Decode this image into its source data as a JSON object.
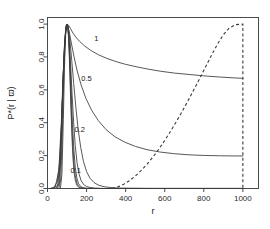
{
  "chart_data": {
    "type": "line",
    "title": "",
    "xlabel": "r",
    "ylabel": "P*(r | ϖ)",
    "xlim": [
      0,
      1080
    ],
    "ylim": [
      0,
      1.04
    ],
    "xticks": [
      0,
      200,
      400,
      600,
      800,
      1000
    ],
    "xticklabels": [
      "0",
      "200",
      "400",
      "600",
      "800",
      "1000"
    ],
    "yticks": [
      0.0,
      0.2,
      0.4,
      0.6,
      0.8,
      1.0
    ],
    "yticklabels": [
      "0.0",
      "0.2",
      "0.4",
      "0.6",
      "0.8",
      "1.0"
    ],
    "grid": false,
    "legend": "none",
    "annotations": [
      {
        "text": "1",
        "x": 250,
        "y": 0.895
      },
      {
        "text": "0.5",
        "x": 200,
        "y": 0.655
      },
      {
        "text": "0.2",
        "x": 165,
        "y": 0.345
      },
      {
        "text": "0.1",
        "x": 145,
        "y": 0.095
      }
    ],
    "series": [
      {
        "name": "1",
        "style": "solid",
        "label": "1",
        "points": [
          [
            10,
            0.0
          ],
          [
            30,
            0.003
          ],
          [
            50,
            0.04
          ],
          [
            62,
            0.16
          ],
          [
            72,
            0.4
          ],
          [
            80,
            0.66
          ],
          [
            88,
            0.88
          ],
          [
            95,
            0.975
          ],
          [
            100,
            1.0
          ],
          [
            108,
            0.993
          ],
          [
            118,
            0.972
          ],
          [
            130,
            0.946
          ],
          [
            145,
            0.921
          ],
          [
            165,
            0.894
          ],
          [
            190,
            0.867
          ],
          [
            220,
            0.841
          ],
          [
            260,
            0.814
          ],
          [
            300,
            0.793
          ],
          [
            350,
            0.772
          ],
          [
            400,
            0.755
          ],
          [
            460,
            0.739
          ],
          [
            520,
            0.725
          ],
          [
            580,
            0.713
          ],
          [
            650,
            0.702
          ],
          [
            720,
            0.694
          ],
          [
            800,
            0.685
          ],
          [
            880,
            0.678
          ],
          [
            950,
            0.673
          ],
          [
            1000,
            0.67
          ]
        ]
      },
      {
        "name": "0.5",
        "style": "solid",
        "label": "0.5",
        "points": [
          [
            15,
            0.0
          ],
          [
            40,
            0.01
          ],
          [
            58,
            0.11
          ],
          [
            70,
            0.38
          ],
          [
            80,
            0.69
          ],
          [
            90,
            0.91
          ],
          [
            97,
            0.99
          ],
          [
            100,
            1.0
          ],
          [
            110,
            0.96
          ],
          [
            122,
            0.885
          ],
          [
            136,
            0.8
          ],
          [
            152,
            0.715
          ],
          [
            172,
            0.63
          ],
          [
            196,
            0.55
          ],
          [
            225,
            0.478
          ],
          [
            260,
            0.413
          ],
          [
            300,
            0.358
          ],
          [
            345,
            0.315
          ],
          [
            395,
            0.282
          ],
          [
            450,
            0.256
          ],
          [
            510,
            0.236
          ],
          [
            575,
            0.222
          ],
          [
            645,
            0.212
          ],
          [
            720,
            0.205
          ],
          [
            800,
            0.201
          ],
          [
            880,
            0.199
          ],
          [
            950,
            0.198
          ],
          [
            1000,
            0.198
          ]
        ]
      },
      {
        "name": "0.2",
        "style": "solid",
        "label": "0.2",
        "points": [
          [
            30,
            0.0
          ],
          [
            52,
            0.02
          ],
          [
            64,
            0.15
          ],
          [
            74,
            0.47
          ],
          [
            84,
            0.79
          ],
          [
            93,
            0.96
          ],
          [
            100,
            1.0
          ],
          [
            107,
            0.975
          ],
          [
            115,
            0.9
          ],
          [
            124,
            0.78
          ],
          [
            134,
            0.64
          ],
          [
            145,
            0.495
          ],
          [
            157,
            0.36
          ],
          [
            170,
            0.25
          ],
          [
            184,
            0.165
          ],
          [
            200,
            0.103
          ],
          [
            218,
            0.062
          ],
          [
            238,
            0.036
          ],
          [
            262,
            0.02
          ],
          [
            290,
            0.011
          ],
          [
            320,
            0.006
          ],
          [
            360,
            0.003
          ],
          [
            420,
            0.002
          ],
          [
            520,
            0.001
          ],
          [
            700,
            0.001
          ],
          [
            1000,
            0.001
          ]
        ]
      },
      {
        "name": "0.1",
        "style": "solid",
        "label": "0.1",
        "points": [
          [
            42,
            0.0
          ],
          [
            58,
            0.03
          ],
          [
            68,
            0.21
          ],
          [
            77,
            0.56
          ],
          [
            86,
            0.85
          ],
          [
            94,
            0.975
          ],
          [
            100,
            1.0
          ],
          [
            106,
            0.975
          ],
          [
            112,
            0.885
          ],
          [
            119,
            0.74
          ],
          [
            126,
            0.57
          ],
          [
            134,
            0.4
          ],
          [
            142,
            0.262
          ],
          [
            151,
            0.158
          ],
          [
            161,
            0.09
          ],
          [
            172,
            0.048
          ],
          [
            185,
            0.024
          ],
          [
            200,
            0.012
          ],
          [
            218,
            0.006
          ],
          [
            240,
            0.003
          ],
          [
            270,
            0.001
          ],
          [
            320,
            0.0
          ],
          [
            500,
            0.0
          ],
          [
            1000,
            0.0
          ]
        ]
      },
      {
        "name": "narrow-3",
        "style": "solid",
        "label": "",
        "points": [
          [
            50,
            0.0
          ],
          [
            62,
            0.04
          ],
          [
            71,
            0.28
          ],
          [
            79,
            0.65
          ],
          [
            88,
            0.9
          ],
          [
            95,
            0.99
          ],
          [
            100,
            1.0
          ],
          [
            105,
            0.98
          ],
          [
            110,
            0.9
          ],
          [
            116,
            0.75
          ],
          [
            122,
            0.57
          ],
          [
            128,
            0.39
          ],
          [
            135,
            0.235
          ],
          [
            142,
            0.13
          ],
          [
            150,
            0.065
          ],
          [
            159,
            0.03
          ],
          [
            170,
            0.012
          ],
          [
            182,
            0.005
          ],
          [
            196,
            0.002
          ],
          [
            215,
            0.001
          ],
          [
            240,
            0.0
          ],
          [
            400,
            0.0
          ],
          [
            1000,
            0.0
          ]
        ]
      },
      {
        "name": "narrow-2",
        "style": "solid",
        "label": "",
        "points": [
          [
            58,
            0.0
          ],
          [
            68,
            0.06
          ],
          [
            76,
            0.34
          ],
          [
            84,
            0.72
          ],
          [
            92,
            0.94
          ],
          [
            97,
            0.995
          ],
          [
            100,
            1.0
          ],
          [
            104,
            0.985
          ],
          [
            108,
            0.92
          ],
          [
            113,
            0.79
          ],
          [
            118,
            0.62
          ],
          [
            123,
            0.44
          ],
          [
            129,
            0.275
          ],
          [
            135,
            0.155
          ],
          [
            142,
            0.078
          ],
          [
            150,
            0.035
          ],
          [
            159,
            0.014
          ],
          [
            170,
            0.005
          ],
          [
            184,
            0.002
          ],
          [
            200,
            0.0
          ],
          [
            300,
            0.0
          ],
          [
            1000,
            0.0
          ]
        ]
      },
      {
        "name": "narrow-1",
        "style": "solid",
        "label": "",
        "points": [
          [
            66,
            0.0
          ],
          [
            74,
            0.09
          ],
          [
            81,
            0.42
          ],
          [
            88,
            0.79
          ],
          [
            94,
            0.96
          ],
          [
            98,
            0.998
          ],
          [
            100,
            1.0
          ],
          [
            103,
            0.99
          ],
          [
            107,
            0.935
          ],
          [
            111,
            0.825
          ],
          [
            115,
            0.67
          ],
          [
            120,
            0.49
          ],
          [
            125,
            0.32
          ],
          [
            130,
            0.19
          ],
          [
            136,
            0.1
          ],
          [
            143,
            0.046
          ],
          [
            151,
            0.018
          ],
          [
            160,
            0.006
          ],
          [
            172,
            0.002
          ],
          [
            188,
            0.0
          ],
          [
            260,
            0.0
          ],
          [
            1000,
            0.0
          ]
        ]
      },
      {
        "name": "prior",
        "style": "dashed",
        "label": "",
        "points": [
          [
            330,
            0.0
          ],
          [
            360,
            0.01
          ],
          [
            390,
            0.026
          ],
          [
            420,
            0.048
          ],
          [
            450,
            0.076
          ],
          [
            480,
            0.11
          ],
          [
            510,
            0.148
          ],
          [
            540,
            0.192
          ],
          [
            570,
            0.24
          ],
          [
            600,
            0.292
          ],
          [
            630,
            0.348
          ],
          [
            660,
            0.408
          ],
          [
            690,
            0.47
          ],
          [
            720,
            0.535
          ],
          [
            750,
            0.603
          ],
          [
            780,
            0.672
          ],
          [
            810,
            0.742
          ],
          [
            840,
            0.812
          ],
          [
            870,
            0.878
          ],
          [
            900,
            0.935
          ],
          [
            930,
            0.975
          ],
          [
            960,
            0.996
          ],
          [
            1000,
            1.0
          ],
          [
            1000,
            0.0
          ]
        ]
      }
    ]
  }
}
